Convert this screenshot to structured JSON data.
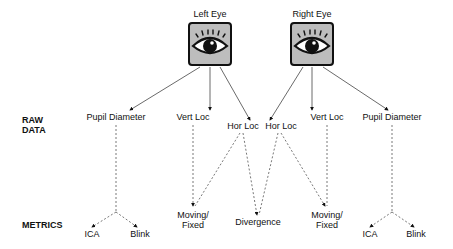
{
  "row_labels": {
    "raw_data": [
      "RAW",
      "DATA"
    ],
    "metrics": "METRICS"
  },
  "eyes": [
    {
      "title": "Left Eye",
      "icon": "eye-icon"
    },
    {
      "title": "Right Eye",
      "icon": "eye-icon"
    }
  ],
  "raw_data": {
    "left": [
      "Pupil Diameter",
      "Vert Loc",
      "Hor Loc"
    ],
    "right": [
      "Hor Loc",
      "Vert Loc",
      "Pupil Diameter"
    ]
  },
  "metrics": {
    "left_pupil": [
      "ICA",
      "Blink"
    ],
    "left_moving": [
      "Moving/",
      "Fixed"
    ],
    "divergence": "Divergence",
    "right_moving": [
      "Moving/",
      "Fixed"
    ],
    "right_pupil": [
      "ICA",
      "Blink"
    ]
  }
}
